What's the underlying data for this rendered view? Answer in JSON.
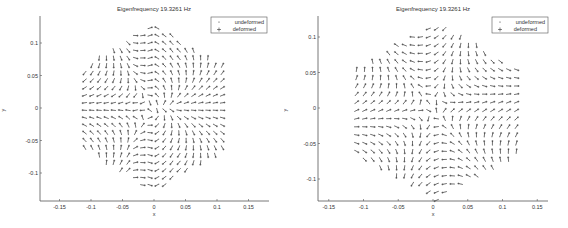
{
  "chart_data": [
    {
      "type": "quiver",
      "title": "Eigenfrequency 19.3261 Hz",
      "xlabel": "x",
      "ylabel": "y",
      "xlim": [
        -0.18,
        0.18
      ],
      "ylim": [
        -0.14,
        0.14
      ],
      "xticks": [
        -0.15,
        -0.1,
        -0.05,
        0,
        0.05,
        0.1,
        0.15
      ],
      "xtick_labels": [
        "-0.15",
        "-0.1",
        "-0.05",
        "0",
        "0.05",
        "0.1",
        "0.15"
      ],
      "yticks": [
        -0.1,
        -0.05,
        0,
        0.05,
        0.1
      ],
      "ytick_labels": [
        "-0.1",
        "-0.05",
        "0",
        "0.05",
        "0.1"
      ],
      "legend": [
        {
          "label": "undeformed",
          "marker": "."
        },
        {
          "label": "deformed",
          "marker": "+"
        }
      ],
      "legend_position": "upper right",
      "grid": false,
      "domain_shape": "hexagon (vertices at top and bottom)",
      "domain_extent": {
        "x": [
          -0.11,
          0.11
        ],
        "y": [
          -0.13,
          0.13
        ]
      },
      "mode_pattern": "vertical flow at top/bottom centre, horizontal flow at left/right sides"
    },
    {
      "type": "quiver",
      "title": "Eigenfrequency 19.3261 Hz",
      "xlabel": "x",
      "ylabel": "y",
      "xlim": [
        -0.165,
        0.18
      ],
      "ylim": [
        -0.13,
        0.135
      ],
      "xticks": [
        -0.15,
        -0.1,
        -0.05,
        0,
        0.05,
        0.1,
        0.15
      ],
      "xtick_labels": [
        "-0.15",
        "-0.1",
        "-0.05",
        "0",
        "0.05",
        "0.1",
        "0.15"
      ],
      "yticks": [
        -0.1,
        -0.05,
        0,
        0.05,
        0.1
      ],
      "ytick_labels": [
        "-0.1",
        "-0.05",
        "0",
        "0.05",
        "0.1"
      ],
      "legend": [
        {
          "label": "undeformed",
          "marker": "."
        },
        {
          "label": "deformed",
          "marker": "+"
        }
      ],
      "legend_position": "upper right",
      "grid": false,
      "domain_shape": "hexagon (vertices at top and bottom)",
      "domain_extent": {
        "x": [
          -0.11,
          0.12
        ],
        "y": [
          -0.13,
          0.12
        ]
      },
      "mode_pattern": "three-lobed rotational flow, diagonal streams meeting near origin"
    }
  ],
  "plots": [
    {
      "title": "Eigenfrequency 19.3261 Hz",
      "xlabel": "x",
      "ylabel": "y",
      "legend_undeformed": "undeformed",
      "legend_deformed": "deformed"
    },
    {
      "title": "Eigenfrequency 19.3261 Hz",
      "xlabel": "x",
      "ylabel": "y",
      "legend_undeformed": "undeformed",
      "legend_deformed": "deformed"
    }
  ]
}
